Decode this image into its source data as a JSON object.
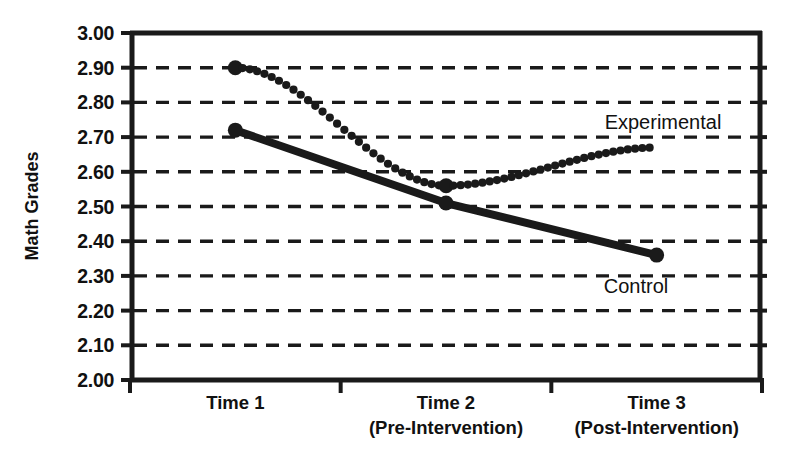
{
  "chart_data": {
    "type": "line",
    "title": "",
    "xlabel": "",
    "ylabel": "Math Grades",
    "ylim": [
      2.0,
      3.0
    ],
    "ytick_step": 0.1,
    "grid": true,
    "grid_style": "dashed-horizontal",
    "legend_position": "inline-annotation",
    "categories": [
      "Time 1",
      "Time 2",
      "Time 3"
    ],
    "category_sublabels": [
      "",
      "(Pre-Intervention)",
      "(Post-Intervention)"
    ],
    "ytick_labels": [
      "3.00",
      "2.90",
      "2.80",
      "2.70",
      "2.60",
      "2.50",
      "2.40",
      "2.30",
      "2.20",
      "2.10",
      "2.00"
    ],
    "ytick_values": [
      3.0,
      2.9,
      2.8,
      2.7,
      2.6,
      2.5,
      2.4,
      2.3,
      2.2,
      2.1,
      2.0
    ],
    "series": [
      {
        "name": "Experimental",
        "style": "dotted",
        "color": "#1a1a1a",
        "values": [
          2.9,
          2.56,
          2.67
        ],
        "curve": "smooth-dip",
        "label_text": "Experimental",
        "label_value": 2.755
      },
      {
        "name": "Control",
        "style": "solid",
        "color": "#1a1a1a",
        "values": [
          2.72,
          2.51,
          2.36
        ],
        "curve": "linear",
        "label_text": "Control",
        "label_value": 2.255
      }
    ]
  },
  "axis": {
    "y_title": "Math Grades",
    "y_labels": [
      "3.00",
      "2.90",
      "2.80",
      "2.70",
      "2.60",
      "2.50",
      "2.40",
      "2.30",
      "2.20",
      "2.10",
      "2.00"
    ],
    "x_labels": [
      "Time 1",
      "Time 2",
      "Time 3"
    ],
    "x_sublabels": [
      "",
      "(Pre-Intervention)",
      "(Post-Intervention)"
    ]
  },
  "annotations": {
    "experimental_label": "Experimental",
    "control_label": "Control"
  },
  "colors": {
    "ink": "#1a1a1a",
    "background": "#ffffff",
    "grid": "#1a1a1a"
  }
}
